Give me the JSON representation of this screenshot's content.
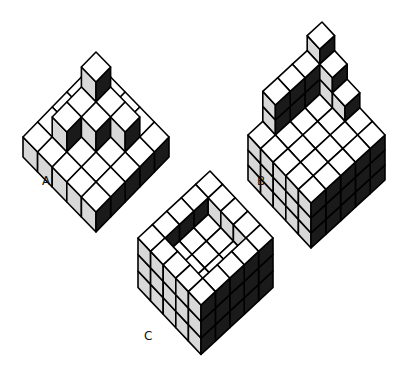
{
  "figure": {
    "colors": {
      "top": "#ffffff",
      "left": "#d8d8d8",
      "right": "#1a1a1a",
      "stroke": "#000000"
    },
    "figures": [
      {
        "id": "A",
        "label": "A",
        "label_pos": [
          42,
          175
        ],
        "origin": [
          96,
          22
        ],
        "u": [
          14.6,
          15.0
        ],
        "v": [
          -14.6,
          15.0
        ],
        "h": 20,
        "heights": [
          [
            1,
            1,
            1,
            1,
            1
          ],
          [
            1,
            3,
            2,
            2,
            1
          ],
          [
            1,
            2,
            2,
            1,
            1
          ],
          [
            1,
            2,
            1,
            1,
            1
          ],
          [
            1,
            1,
            1,
            1,
            1
          ]
        ]
      },
      {
        "id": "B",
        "label": "B",
        "label_pos": [
          257,
          175
        ],
        "origin": [
          322,
          22
        ],
        "u": [
          12.6,
          13.6
        ],
        "v": [
          -14.8,
          13.6
        ],
        "h": 15,
        "base_shift": 45,
        "heights": [
          [
            6,
            5,
            5,
            5,
            3
          ],
          [
            5,
            3,
            3,
            3,
            3
          ],
          [
            4,
            3,
            3,
            3,
            3
          ],
          [
            3,
            3,
            3,
            3,
            3
          ],
          [
            3,
            3,
            3,
            3,
            3
          ]
        ]
      },
      {
        "id": "C",
        "label": "C",
        "label_pos": [
          144,
          330
        ],
        "origin": [
          210,
          171
        ],
        "u": [
          12.6,
          13.4
        ],
        "v": [
          -14.4,
          13.4
        ],
        "h": 16.5,
        "heights": [
          [
            3,
            3,
            3,
            3,
            3
          ],
          [
            3,
            2,
            2,
            2,
            3
          ],
          [
            3,
            2,
            2,
            2,
            3
          ],
          [
            3,
            2,
            2,
            2,
            3
          ],
          [
            3,
            3,
            3,
            3,
            3
          ]
        ]
      }
    ]
  }
}
